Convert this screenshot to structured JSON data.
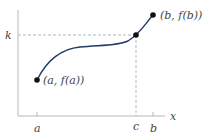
{
  "figure": {
    "labels": {
      "y_level": "k",
      "x_axis": "x",
      "tick_a": "a",
      "tick_c": "c",
      "tick_b": "b",
      "point_a": "(a, f(a))",
      "point_b": "(b, f(b))"
    },
    "colors": {
      "curve": "#1f3a66",
      "axis": "#b8b8b8",
      "dashed": "#a8b8c8",
      "point": "#111111",
      "text": "#444444"
    }
  }
}
